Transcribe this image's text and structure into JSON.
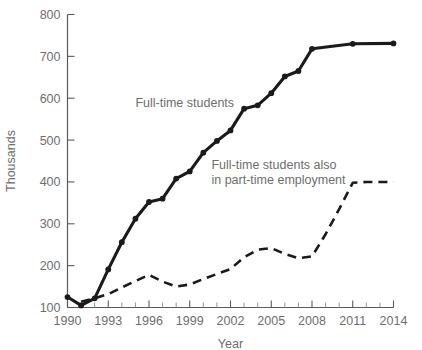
{
  "chart_data": {
    "type": "line",
    "title": "",
    "xlabel": "Year",
    "ylabel": "Thousands",
    "xlim": [
      1990,
      2014
    ],
    "ylim": [
      100,
      800
    ],
    "grid": false,
    "legend_position": "inline-annotation",
    "x_ticks": [
      1990,
      1993,
      1996,
      1999,
      2002,
      2005,
      2008,
      2011,
      2014
    ],
    "x_tick_labels": [
      "1990",
      "1993",
      "1996",
      "1999",
      "2002",
      "2005",
      "2008",
      "2011",
      "2014"
    ],
    "x_minor_ticks": [
      1991,
      1992,
      1994,
      1995,
      1997,
      1998,
      2000,
      2001,
      2003,
      2004,
      2006,
      2007,
      2009,
      2010,
      2012,
      2013
    ],
    "y_ticks": [
      100,
      200,
      300,
      400,
      500,
      600,
      700,
      800
    ],
    "y_tick_labels": [
      "100",
      "200",
      "300",
      "400",
      "500",
      "600",
      "700",
      "800"
    ],
    "series": [
      {
        "name": "Full-time students",
        "style": "solid",
        "markers": true,
        "color": "#1a1a1a",
        "x": [
          1990,
          1991,
          1992,
          1993,
          1994,
          1995,
          1996,
          1997,
          1998,
          1999,
          2000,
          2001,
          2002,
          2003,
          2004,
          2005,
          2006,
          2007,
          2008,
          2011,
          2014
        ],
        "values": [
          125,
          105,
          122,
          191,
          256,
          312,
          352,
          360,
          408,
          425,
          470,
          498,
          523,
          575,
          583,
          612,
          652,
          665,
          718,
          730,
          731
        ]
      },
      {
        "name": "Full-time students also in part-time employment",
        "style": "dashed",
        "markers": false,
        "color": "#1a1a1a",
        "x": [
          1991,
          1992,
          1993,
          1994,
          1995,
          1996,
          1997,
          1998,
          1999,
          2000,
          2001,
          2002,
          2003,
          2004,
          2005,
          2006,
          2007,
          2008,
          2009,
          2010,
          2011,
          2012,
          2013,
          2014
        ],
        "values": [
          114,
          122,
          132,
          148,
          163,
          178,
          162,
          150,
          155,
          168,
          180,
          192,
          220,
          238,
          242,
          228,
          218,
          222,
          275,
          335,
          398,
          400,
          400,
          400
        ]
      }
    ],
    "annotations": [
      {
        "id": "full-time-students",
        "lines": [
          "Full-time students"
        ],
        "x": 1995.0,
        "y": 578
      },
      {
        "id": "part-time-employment",
        "lines": [
          "Full-time students also",
          "in part-time employment"
        ],
        "x": 2000.6,
        "y": 432
      }
    ]
  },
  "colors": {
    "line": "#1a1a1a",
    "text": "#6e6e6e",
    "axis": "#5a5a5a",
    "background": "#ffffff"
  }
}
